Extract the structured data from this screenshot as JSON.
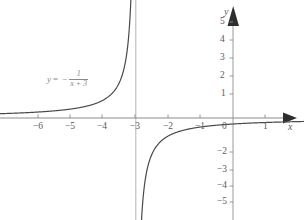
{
  "figure": {
    "title": "",
    "equation_label": {
      "lhs": "y",
      "equals": "=",
      "minus": "−",
      "numerator": "1",
      "denominator": "x + 3"
    },
    "axis_names": {
      "x": "x",
      "y": "y"
    },
    "colors": {
      "curve": "#4a4a4a",
      "axis": "#6e6e6e",
      "asymptote": "#b9b9b9",
      "tick_label": "#5a5a5a",
      "equation": "#8a8a8a",
      "background": "#ffffff"
    }
  },
  "chart_data": {
    "type": "line",
    "title": "",
    "xlabel": "x",
    "ylabel": "y",
    "xlim": [
      -7.3,
      2.2
    ],
    "ylim": [
      -6.1,
      5.6
    ],
    "grid": false,
    "legend": "none",
    "annotations": [
      {
        "text": "y = -1/(x+3)",
        "x": -5.4,
        "y": 2.2
      }
    ],
    "xticks": [
      -6,
      -5,
      -4,
      -3,
      -2,
      -1,
      0,
      1
    ],
    "xtick_labels": [
      "−6",
      "−5",
      "−4",
      "−3",
      "−2",
      "−1",
      "0",
      "1"
    ],
    "yticks": [
      5,
      4,
      3,
      2,
      1,
      0,
      -2,
      -3,
      -4,
      -5
    ],
    "ytick_labels": [
      "5",
      "4",
      "3",
      "2",
      "1",
      "0",
      "−2",
      "−3",
      "−4",
      "−5"
    ],
    "asymptotes": {
      "vertical": [
        -3
      ],
      "horizontal": [
        0
      ]
    },
    "series": [
      {
        "name": "y = -1/(x+3) left branch",
        "domain": [
          -7.3,
          -3.0
        ],
        "points": [
          [
            -7.3,
            0.233
          ],
          [
            -7.0,
            0.25
          ],
          [
            -6.5,
            0.286
          ],
          [
            -6.0,
            0.333
          ],
          [
            -5.5,
            0.4
          ],
          [
            -5.0,
            0.5
          ],
          [
            -4.75,
            0.571
          ],
          [
            -4.5,
            0.667
          ],
          [
            -4.25,
            0.8
          ],
          [
            -4.0,
            1.0
          ],
          [
            -3.8,
            1.25
          ],
          [
            -3.6,
            1.667
          ],
          [
            -3.5,
            2.0
          ],
          [
            -3.4,
            2.5
          ],
          [
            -3.3,
            3.333
          ],
          [
            -3.25,
            4.0
          ],
          [
            -3.2,
            5.0
          ],
          [
            -3.17,
            6.0
          ]
        ]
      },
      {
        "name": "y = -1/(x+3) right branch",
        "domain": [
          -3.0,
          2.2
        ],
        "points": [
          [
            -2.84,
            -6.25
          ],
          [
            -2.86,
            -7.143
          ],
          [
            -2.9,
            -10.0
          ],
          [
            -2.88,
            -8.333
          ],
          [
            -2.84,
            -6.25
          ],
          [
            -2.8,
            -5.0
          ],
          [
            -2.75,
            -4.0
          ],
          [
            -2.7,
            -3.333
          ],
          [
            -2.6,
            -2.5
          ],
          [
            -2.5,
            -2.0
          ],
          [
            -2.4,
            -1.667
          ],
          [
            -2.25,
            -1.333
          ],
          [
            -2.0,
            -1.0
          ],
          [
            -1.75,
            -0.8
          ],
          [
            -1.5,
            -0.667
          ],
          [
            -1.0,
            -0.5
          ],
          [
            -0.5,
            -0.4
          ],
          [
            0.0,
            -0.333
          ],
          [
            0.5,
            -0.286
          ],
          [
            1.0,
            -0.25
          ],
          [
            1.5,
            -0.222
          ],
          [
            2.2,
            -0.192
          ]
        ]
      }
    ]
  }
}
